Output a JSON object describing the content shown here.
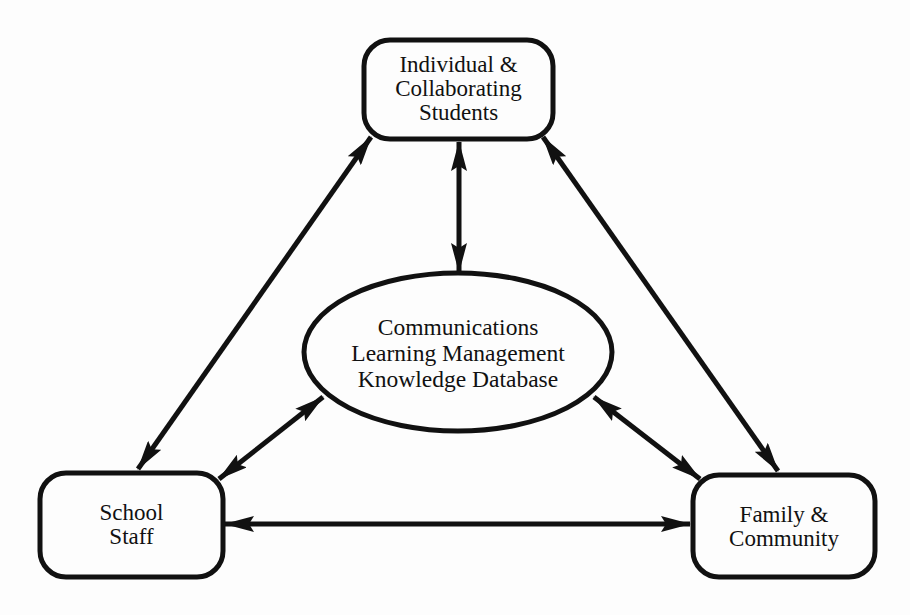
{
  "diagram": {
    "type": "relationship-triangle",
    "colors": {
      "stroke": "#111111",
      "background": "#fdfdfd",
      "text": "#111111"
    },
    "nodes": {
      "students": {
        "shape": "rounded-rectangle",
        "lines": [
          "Individual &",
          "Collaborating",
          "Students"
        ]
      },
      "center": {
        "shape": "ellipse",
        "lines": [
          "Communications",
          "Learning Management",
          "Knowledge Database"
        ]
      },
      "staff": {
        "shape": "rounded-rectangle",
        "lines": [
          "School",
          "Staff"
        ]
      },
      "family": {
        "shape": "rounded-rectangle",
        "lines": [
          "Family &",
          "Community"
        ]
      }
    },
    "edges": [
      {
        "from": "students",
        "to": "staff",
        "direction": "bidirectional"
      },
      {
        "from": "students",
        "to": "family",
        "direction": "bidirectional"
      },
      {
        "from": "students",
        "to": "center",
        "direction": "bidirectional"
      },
      {
        "from": "center",
        "to": "staff",
        "direction": "bidirectional"
      },
      {
        "from": "center",
        "to": "family",
        "direction": "bidirectional"
      },
      {
        "from": "staff",
        "to": "family",
        "direction": "bidirectional"
      }
    ]
  }
}
